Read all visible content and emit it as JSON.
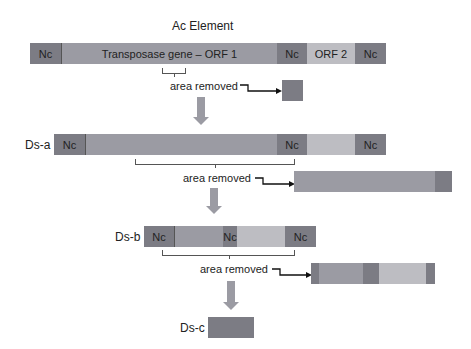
{
  "title": "Ac Element",
  "ac_element": {
    "segments": [
      {
        "label": "Nc",
        "type": "noncoding"
      },
      {
        "label": "Transposase gene – ORF 1",
        "type": "orf1"
      },
      {
        "label": "Nc",
        "type": "noncoding"
      },
      {
        "label": "ORF 2",
        "type": "orf2"
      },
      {
        "label": "Nc",
        "type": "noncoding"
      }
    ],
    "removed_label": "area removed"
  },
  "ds_a": {
    "name": "Ds-a",
    "segments": [
      {
        "label": "Nc"
      },
      {
        "label": ""
      },
      {
        "label": "Nc"
      },
      {
        "label": ""
      },
      {
        "label": "Nc"
      }
    ],
    "removed_label": "area removed"
  },
  "ds_b": {
    "name": "Ds-b",
    "segments": [
      {
        "label": "Nc"
      },
      {
        "label": ""
      },
      {
        "label": "Nc"
      },
      {
        "label": ""
      },
      {
        "label": "Nc"
      }
    ],
    "removed_label": "area removed"
  },
  "ds_c": {
    "name": "Ds-c"
  },
  "colors": {
    "noncoding": "#7c7c84",
    "orf1": "#9b9ba3",
    "orf2": "#bdbdc2",
    "arrow": "#9b9ba3"
  }
}
